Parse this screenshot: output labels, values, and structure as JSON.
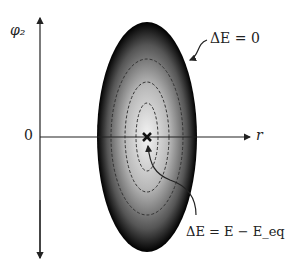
{
  "diagram": {
    "axes": {
      "y_label": "φ₂",
      "x_label": "r",
      "origin_label": "0"
    },
    "annotations": {
      "boundary": "ΔE = 0",
      "energy": "ΔE = E − E_eq"
    },
    "colors": {
      "ellipse_edge": "#000000",
      "ellipse_center": "#f4f4f4",
      "contours": "#333333",
      "axes": "#222222"
    },
    "contour_count": 3
  }
}
